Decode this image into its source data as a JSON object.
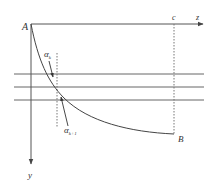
{
  "diagram": {
    "labels": {
      "origin": "A",
      "end_point": "B",
      "x_axis": "z",
      "y_axis": "y",
      "c_mark": "c",
      "alpha_k": "α",
      "alpha_k_sub": "k",
      "alpha_k1": "α",
      "alpha_k1_sub": "k+1"
    },
    "colors": {
      "line": "#555555",
      "text": "#333333",
      "background": "#ffffff"
    }
  }
}
